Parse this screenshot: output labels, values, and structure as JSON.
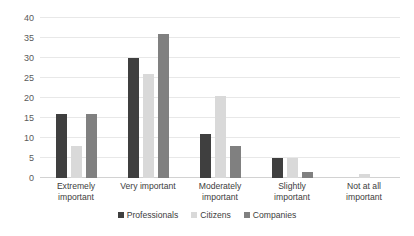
{
  "chart_data": {
    "type": "bar",
    "title": "",
    "subtitle": "",
    "xlabel": "",
    "ylabel": "",
    "ylim": [
      0,
      40
    ],
    "yticks": [
      0,
      5,
      10,
      15,
      20,
      25,
      30,
      35,
      40
    ],
    "grid": true,
    "legend_position": "bottom",
    "categories": [
      "Extremely important",
      "Very important",
      "Moderately important",
      "Slightly important",
      "Not at all important"
    ],
    "category_lines": [
      [
        "Extremely",
        "important"
      ],
      [
        "Very important",
        ""
      ],
      [
        "Moderately",
        "important"
      ],
      [
        "Slightly",
        "important"
      ],
      [
        "Not at all",
        "important"
      ]
    ],
    "series": [
      {
        "name": "Professionals",
        "color": "#3f3f3f",
        "values": [
          16,
          30,
          11,
          5,
          0
        ]
      },
      {
        "name": "Citizens",
        "color": "#d9d9d9",
        "values": [
          8,
          26,
          20.5,
          5,
          1
        ]
      },
      {
        "name": "Companies",
        "color": "#808080",
        "values": [
          16,
          36,
          8,
          1.5,
          0
        ]
      }
    ]
  },
  "legend": {
    "items": [
      {
        "label": "Professionals",
        "color": "#3f3f3f"
      },
      {
        "label": "Citizens",
        "color": "#d9d9d9"
      },
      {
        "label": "Companies",
        "color": "#808080"
      }
    ]
  },
  "colors": {
    "gridline": "#e8e8e8",
    "baseline": "#d2d2d2",
    "tick_text": "#5a5a5a",
    "label_text": "#3d3d3d",
    "background": "#ffffff"
  }
}
